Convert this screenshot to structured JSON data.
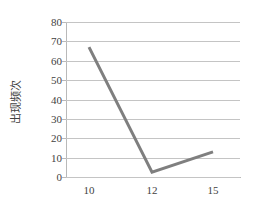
{
  "chart_data": {
    "type": "line",
    "title": "",
    "xlabel": "",
    "ylabel": "出现频次",
    "categories": [
      "10",
      "12",
      "15"
    ],
    "x": [
      10,
      12,
      15
    ],
    "values": [
      67,
      2.5,
      13
    ],
    "series": [
      {
        "name": "出现频次",
        "values": [
          67,
          2.5,
          13
        ]
      }
    ],
    "ylim": [
      0,
      80
    ],
    "yticks": [
      "0",
      "10",
      "20",
      "30",
      "40",
      "50",
      "60",
      "70",
      "80"
    ],
    "ytick_values": [
      0,
      10,
      20,
      30,
      40,
      50,
      60,
      70,
      80
    ],
    "xticks": [
      "10",
      "12",
      "15"
    ],
    "grid": "horizontal",
    "legend": "none",
    "line_color": "#7f7f7f",
    "axis_color": "#b9b9b9",
    "grid_color": "#c4c4c4",
    "text_color": "#3f3f3f",
    "background": "#ffffff"
  }
}
